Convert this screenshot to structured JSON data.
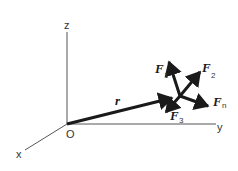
{
  "diagram": {
    "axes": {
      "z_label": "z",
      "y_label": "y",
      "x_label": "x",
      "origin_label": "O"
    },
    "position_vector": {
      "label": "r"
    },
    "forces": [
      {
        "name": "F",
        "sub": "1"
      },
      {
        "name": "F",
        "sub": "2"
      },
      {
        "name": "F",
        "sub": "3"
      },
      {
        "name": "F",
        "sub": "n"
      }
    ],
    "colors": {
      "vector": "#1a1a1a",
      "axis": "#555555",
      "background": "#ffffff"
    }
  }
}
